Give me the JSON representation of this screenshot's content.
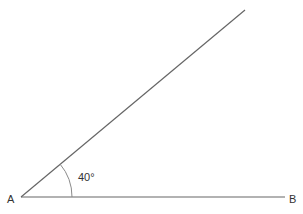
{
  "diagram": {
    "type": "angle",
    "vertex_label": "A",
    "point_label": "B",
    "angle_label": "40°",
    "angle_degrees": 40,
    "colors": {
      "line": "#666666",
      "arc": "#8a8a8a",
      "text": "#333333",
      "background": "#ffffff"
    }
  }
}
